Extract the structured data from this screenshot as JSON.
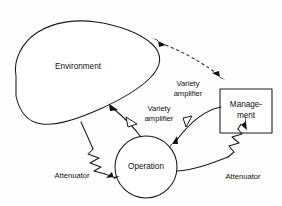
{
  "diagram": {
    "background_color": "#fdfdfd",
    "line_color": "#1a1a1a",
    "text_color": "#111111",
    "nodes": [
      {
        "id": "environment",
        "label": "Environment",
        "shape": "blob",
        "label_x": 78,
        "label_y": 67
      },
      {
        "id": "operation",
        "label": "Operation",
        "shape": "circle",
        "label_x": 146,
        "label_y": 167,
        "cx": 146,
        "cy": 167,
        "r": 31
      },
      {
        "id": "management",
        "label_line1": "Manage-",
        "label_line2": "ment",
        "shape": "rectangle",
        "x": 220,
        "y": 89,
        "width": 52,
        "height": 44
      }
    ],
    "edge_labels": [
      {
        "id": "variety-amplifier-left",
        "line1": "Variety",
        "line2": "amplifier",
        "x": 159,
        "y": 113
      },
      {
        "id": "variety-amplifier-right",
        "line1": "Variety",
        "line2": "amplifier",
        "x": 188,
        "y": 88
      },
      {
        "id": "attenuator-left",
        "text": "Attenuator",
        "x": 72,
        "y": 176
      },
      {
        "id": "attenuator-right",
        "text": "Attenuator",
        "x": 243,
        "y": 177
      }
    ],
    "connectors": [
      {
        "id": "environment-management-link",
        "style": "dashed",
        "arrowheads": "double",
        "from": "environment",
        "to": "management"
      },
      {
        "id": "operation-to-environment-amplifier",
        "style": "solid",
        "symbol": "amplifier",
        "from": "operation",
        "to": "environment"
      },
      {
        "id": "environment-to-operation-attenuator",
        "style": "solid",
        "symbol": "attenuator",
        "from": "environment",
        "to": "operation"
      },
      {
        "id": "management-to-operation-amplifier",
        "style": "solid",
        "symbol": "amplifier",
        "from": "management",
        "to": "operation"
      },
      {
        "id": "operation-to-management-attenuator",
        "style": "solid",
        "symbol": "attenuator",
        "from": "operation",
        "to": "management"
      }
    ]
  }
}
